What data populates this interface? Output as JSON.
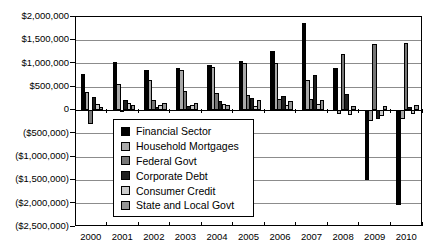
{
  "chart_data": {
    "type": "bar",
    "title": "",
    "xlabel": "",
    "ylabel": "",
    "categories": [
      "2000",
      "2001",
      "2002",
      "2003",
      "2004",
      "2005",
      "2006",
      "2007",
      "2008",
      "2009",
      "2010"
    ],
    "series": [
      {
        "name": "Financial Sector",
        "color": "#000000",
        "values": [
          775000,
          1040000,
          875000,
          910000,
          965000,
          1050000,
          1280000,
          1875000,
          910000,
          -1500000,
          -2025000
        ]
      },
      {
        "name": "Household Mortgages",
        "color": "#a8a8a8",
        "values": [
          390000,
          560000,
          660000,
          875000,
          925000,
          1015000,
          1015000,
          660000,
          -80000,
          -235000,
          -180000
        ]
      },
      {
        "name": "Federal Govt",
        "color": "#767676",
        "values": [
          -295000,
          -10000,
          230000,
          410000,
          370000,
          335000,
          245000,
          245000,
          1210000,
          1425000,
          1445000
        ]
      },
      {
        "name": "Corporate Debt",
        "color": "#1f1f1f",
        "values": [
          295000,
          220000,
          65000,
          85000,
          210000,
          265000,
          315000,
          765000,
          340000,
          -190000,
          80000
        ]
      },
      {
        "name": "Consumer Credit",
        "color": "#cbcbcb",
        "values": [
          145000,
          155000,
          115000,
          120000,
          135000,
          100000,
          120000,
          145000,
          -105000,
          -115000,
          -70000
        ]
      },
      {
        "name": "State and Local Govt",
        "color": "#969696",
        "values": [
          70000,
          110000,
          150000,
          155000,
          120000,
          215000,
          195000,
          230000,
          85000,
          85000,
          120000
        ]
      }
    ],
    "ylim": [
      -2500000,
      2000000
    ],
    "ytick_interval": 500000,
    "ytick_labels": [
      "$2,000,000",
      "$1,500,000",
      "$1,000,000",
      "$500,000",
      "0",
      "($500,000)",
      "($1,000,000)",
      "($1,500,000)",
      "($2,000,000)",
      "($2,500,000)"
    ],
    "grid": true,
    "legend_position": "inside-left",
    "legend_entries": [
      "Financial Sector",
      "Household Mortgages",
      "Federal Govt",
      "Corporate Debt",
      "Consumer Credit",
      "State and Local Govt"
    ]
  }
}
